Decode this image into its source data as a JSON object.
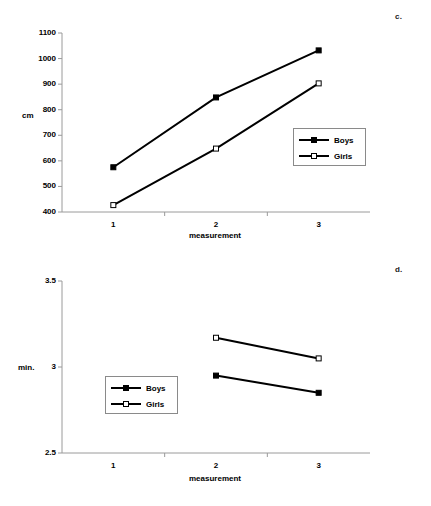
{
  "figure": {
    "panels": [
      {
        "id": "c",
        "label": "c.",
        "legend": {
          "series": [
            "Boys",
            "Girls"
          ]
        },
        "chart_data": {
          "type": "line",
          "title": "",
          "xlabel": "measurement",
          "ylabel": "cm",
          "categories": [
            "1",
            "2",
            "3"
          ],
          "x": [
            1,
            2,
            3
          ],
          "xlim": [
            0.5,
            3.5
          ],
          "ylim": [
            400,
            1100
          ],
          "ytick_labels": [
            "400",
            "500",
            "600",
            "700",
            "800",
            "900",
            "1000",
            "1100"
          ],
          "yticks": [
            400,
            500,
            600,
            700,
            800,
            900,
            1000,
            1100
          ],
          "xtick_labels": [
            "1",
            "2",
            "3"
          ],
          "grid": false,
          "legend_position": "center-right",
          "series": [
            {
              "name": "Boys",
              "marker": "filled-square",
              "values": [
                575,
                848,
                1032
              ]
            },
            {
              "name": "Girls",
              "marker": "open-square",
              "values": [
                427,
                648,
                903
              ]
            }
          ]
        }
      },
      {
        "id": "d",
        "label": "d.",
        "legend": {
          "series": [
            "Boys",
            "Girls"
          ]
        },
        "chart_data": {
          "type": "line",
          "title": "",
          "xlabel": "measurement",
          "ylabel": "min.",
          "categories": [
            "1",
            "2",
            "3"
          ],
          "x": [
            1,
            2,
            3
          ],
          "xlim": [
            0.5,
            3.5
          ],
          "ylim": [
            2.5,
            3.5
          ],
          "ytick_labels": [
            "2.5",
            "3",
            "3.5"
          ],
          "yticks": [
            2.5,
            3,
            3.5
          ],
          "xtick_labels": [
            "1",
            "2",
            "3"
          ],
          "grid": false,
          "legend_position": "center-left",
          "series": [
            {
              "name": "Boys",
              "marker": "filled-square",
              "values": [
                null,
                2.95,
                2.85
              ]
            },
            {
              "name": "Girls",
              "marker": "open-square",
              "values": [
                null,
                3.17,
                3.05
              ]
            }
          ]
        }
      }
    ]
  }
}
